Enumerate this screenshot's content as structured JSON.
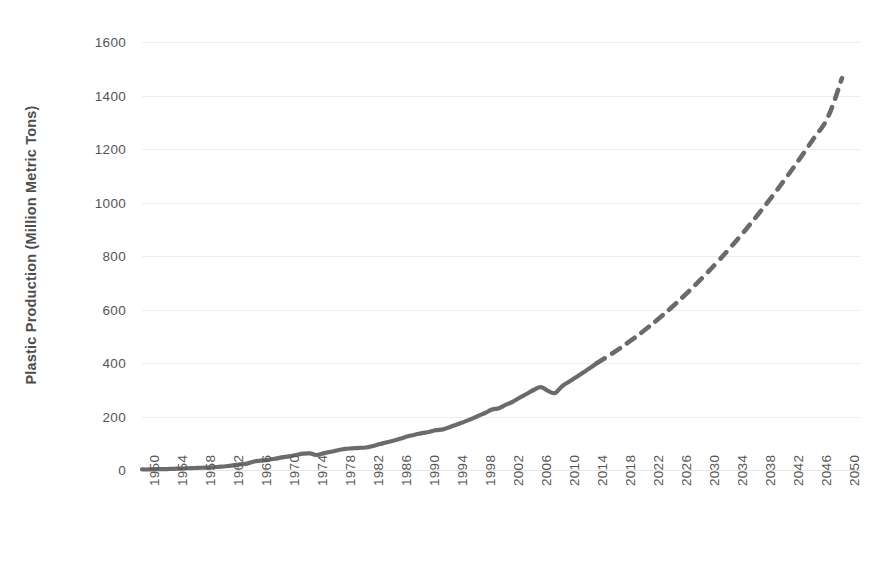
{
  "chart_data": {
    "type": "line",
    "title": "",
    "xlabel": "",
    "ylabel": "Plastic Production (Million Metric Tons)",
    "xlim": [
      1950,
      2050
    ],
    "ylim": [
      0,
      1600
    ],
    "grid": true,
    "legend": "none",
    "ytick_labels": [
      "0",
      "200",
      "400",
      "600",
      "800",
      "1000",
      "1200",
      "1400",
      "1600"
    ],
    "ytick_values": [
      0,
      200,
      400,
      600,
      800,
      1000,
      1200,
      1400,
      1600
    ],
    "xtick_labels": [
      "1950",
      "1954",
      "1958",
      "1962",
      "1966",
      "1970",
      "1974",
      "1978",
      "1982",
      "1986",
      "1990",
      "1994",
      "1998",
      "2002",
      "2006",
      "2010",
      "2014",
      "2018",
      "2022",
      "2026",
      "2030",
      "2034",
      "2038",
      "2042",
      "2046",
      "2050"
    ],
    "xtick_values": [
      1950,
      1954,
      1958,
      1962,
      1966,
      1970,
      1974,
      1978,
      1982,
      1986,
      1990,
      1994,
      1998,
      2002,
      2006,
      2010,
      2014,
      2018,
      2022,
      2026,
      2030,
      2034,
      2038,
      2042,
      2046,
      2050
    ],
    "xtick_rotation": -90,
    "series": [
      {
        "name": "Historical plastic production",
        "style": "solid",
        "color": "#6b6b6b",
        "x": [
          1950,
          1951,
          1952,
          1953,
          1954,
          1955,
          1956,
          1957,
          1958,
          1959,
          1960,
          1961,
          1962,
          1963,
          1964,
          1965,
          1966,
          1967,
          1968,
          1969,
          1970,
          1971,
          1972,
          1973,
          1974,
          1975,
          1976,
          1977,
          1978,
          1979,
          1980,
          1981,
          1982,
          1983,
          1984,
          1985,
          1986,
          1987,
          1988,
          1989,
          1990,
          1991,
          1992,
          1993,
          1994,
          1995,
          1996,
          1997,
          1998,
          1999,
          2000,
          2001,
          2002,
          2003,
          2004,
          2005,
          2006,
          2007,
          2008,
          2009,
          2010,
          2011,
          2012,
          2013,
          2014,
          2015
        ],
        "y": [
          2,
          2,
          3,
          3,
          4,
          5,
          6,
          7,
          8,
          9,
          10,
          12,
          14,
          17,
          21,
          24,
          32,
          35,
          38,
          42,
          47,
          51,
          56,
          61,
          62,
          56,
          63,
          68,
          74,
          79,
          81,
          83,
          84,
          90,
          97,
          104,
          110,
          118,
          126,
          132,
          138,
          142,
          149,
          152,
          161,
          170,
          180,
          190,
          202,
          213,
          226,
          231,
          244,
          256,
          271,
          285,
          300,
          310,
          296,
          288,
          313,
          330,
          347,
          364,
          381,
          400
        ]
      },
      {
        "name": "Projected plastic production",
        "style": "dashed",
        "color": "#6b6b6b",
        "x": [
          2015,
          2016,
          2018,
          2020,
          2022,
          2024,
          2026,
          2028,
          2030,
          2032,
          2034,
          2036,
          2038,
          2040,
          2042,
          2044,
          2046,
          2048,
          2050
        ],
        "y": [
          400,
          416,
          450,
          487,
          527,
          570,
          616,
          665,
          717,
          772,
          830,
          891,
          955,
          1022,
          1092,
          1165,
          1241,
          1320,
          1465
        ]
      }
    ],
    "annotations": [
      {
        "label": "oil-crisis-dip",
        "x": 1975,
        "y": 56
      },
      {
        "label": "financial-crisis-dip",
        "x": 2009,
        "y": 288
      },
      {
        "label": "history-forecast-split",
        "x": 2015,
        "y": 400
      }
    ]
  },
  "axes": {
    "y_title": "Plastic Production (Million Metric Tons)"
  },
  "colors": {
    "line": "#6b6b6b",
    "grid": "#ededed",
    "text": "#555555",
    "background": "#ffffff"
  }
}
